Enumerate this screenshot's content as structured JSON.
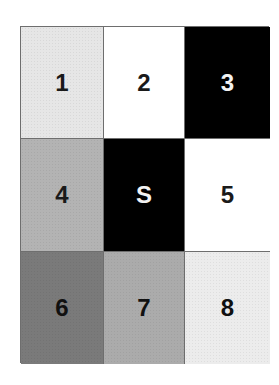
{
  "grid": {
    "rows": 3,
    "columns": 3,
    "cells": [
      {
        "label": "1",
        "fill": "#e6e6e6",
        "text_color": "#1a1a1a"
      },
      {
        "label": "2",
        "fill": "#ffffff",
        "text_color": "#1a1a1a"
      },
      {
        "label": "3",
        "fill": "#000000",
        "text_color": "#f2f2f2"
      },
      {
        "label": "4",
        "fill": "#b3b3b3",
        "text_color": "#1a1a1a"
      },
      {
        "label": "S",
        "fill": "#000000",
        "text_color": "#f2f2f2"
      },
      {
        "label": "5",
        "fill": "#ffffff",
        "text_color": "#1a1a1a"
      },
      {
        "label": "6",
        "fill": "#7a7a7a",
        "text_color": "#111111"
      },
      {
        "label": "7",
        "fill": "#ababab",
        "text_color": "#111111"
      },
      {
        "label": "8",
        "fill": "#ececec",
        "text_color": "#111111"
      }
    ],
    "border_color": "#6e6e6e"
  }
}
